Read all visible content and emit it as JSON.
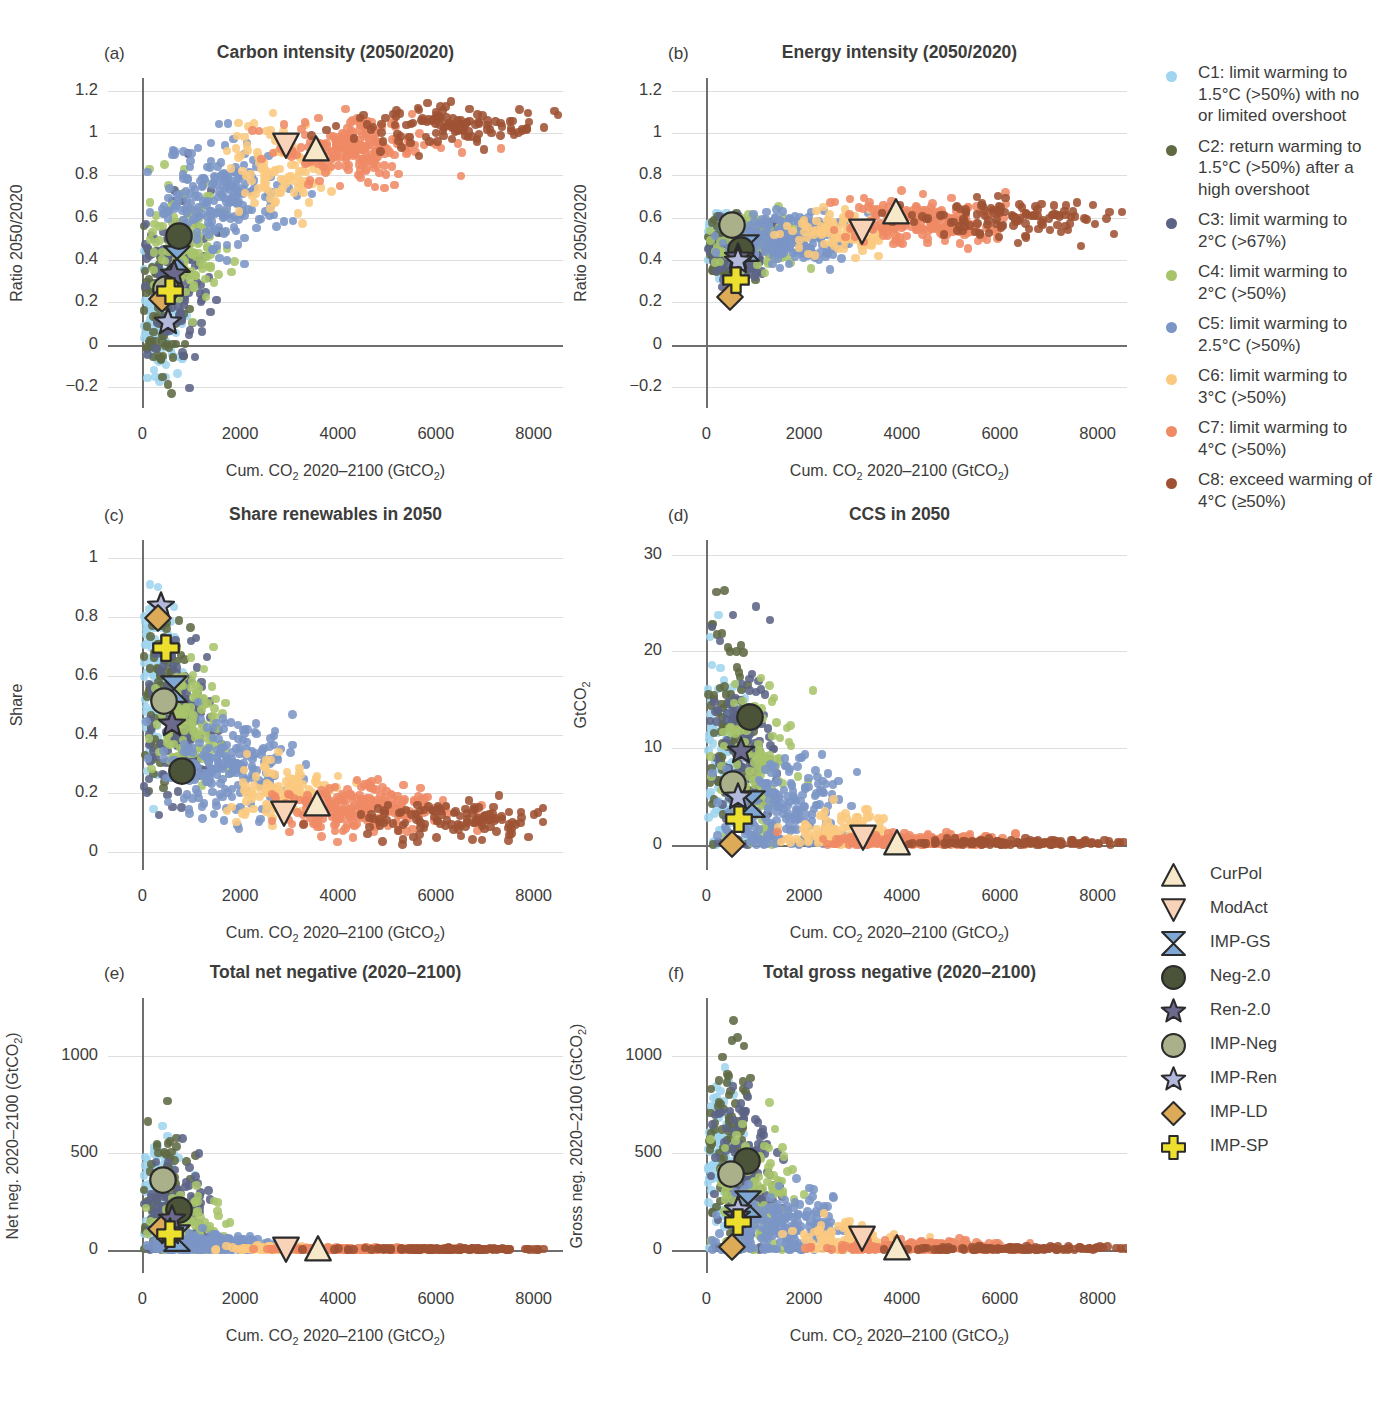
{
  "figure": {
    "cut_heading": "",
    "xlabel_html": "Cum. CO<sub>2</sub> 2020–2100 (GtCO<sub>2</sub>)"
  },
  "colors": {
    "C1": "#9fd5ef",
    "C2": "#5f6a43",
    "C3": "#5c6486",
    "C4": "#a7c46b",
    "C5": "#7b95c6",
    "C6": "#fac97f",
    "C7": "#ef8a65",
    "C8": "#9e5233",
    "axis": "#6f6f6e",
    "grid": "#dedede",
    "text": "#3c3c3b",
    "CurPol": "#f6e8c8",
    "ModAct": "#f9d3b8",
    "IMP-GS": "#7fa7d4",
    "Neg-2.0": "#4b5338",
    "Ren-2.0": "#6c6a8c",
    "IMP-Neg": "#aab18a",
    "IMP-Ren": "#b3b8dd",
    "IMP-LD": "#dda košt"
  },
  "category_legend": [
    {
      "key": "C1",
      "color": "#9fd5ef",
      "label": "C1: limit warming to 1.5°C (>50%) with no or limited overshoot"
    },
    {
      "key": "C2",
      "color": "#5f6a43",
      "label": "C2: return warming to 1.5°C (>50%) after a high overshoot"
    },
    {
      "key": "C3",
      "color": "#5c6486",
      "label": "C3: limit warming to 2°C (>67%)"
    },
    {
      "key": "C4",
      "color": "#a7c46b",
      "label": "C4: limit warming to 2°C (>50%)"
    },
    {
      "key": "C5",
      "color": "#7b95c6",
      "label": "C5: limit warming to 2.5°C (>50%)"
    },
    {
      "key": "C6",
      "color": "#fac97f",
      "label": "C6: limit warming to 3°C (>50%)"
    },
    {
      "key": "C7",
      "color": "#ef8a65",
      "label": "C7: limit warming to 4°C (>50%)"
    },
    {
      "key": "C8",
      "color": "#9e5233",
      "label": "C8: exceed warming of 4°C (≥50%)"
    }
  ],
  "marker_legend": [
    {
      "key": "CurPol",
      "shape": "triangle-up",
      "fill": "#f6e8c8",
      "label": "CurPol"
    },
    {
      "key": "ModAct",
      "shape": "triangle-down",
      "fill": "#f9d3b8",
      "label": "ModAct"
    },
    {
      "key": "IMP-GS",
      "shape": "bowtie",
      "fill": "#7fa7d4",
      "label": "IMP-GS"
    },
    {
      "key": "Neg-2.0",
      "shape": "circle",
      "fill": "#4b5338",
      "label": "Neg-2.0"
    },
    {
      "key": "Ren-2.0",
      "shape": "star",
      "fill": "#6c6a8c",
      "label": "Ren-2.0"
    },
    {
      "key": "IMP-Neg",
      "shape": "circle",
      "fill": "#aab18a",
      "label": "IMP-Neg"
    },
    {
      "key": "IMP-Ren",
      "shape": "star",
      "fill": "#b3b8dd",
      "label": "IMP-Ren"
    },
    {
      "key": "IMP-LD",
      "shape": "diamond",
      "fill": "#ddab57",
      "label": "IMP-LD"
    },
    {
      "key": "IMP-SP",
      "shape": "cross",
      "fill": "#ecdf2e",
      "label": "IMP-SP"
    }
  ],
  "chart_data": [
    {
      "panel": "a",
      "type": "scatter",
      "title": "Carbon intensity (2050/2020)",
      "xlabel_html": "Cum. CO<sub>2</sub> 2020–2100 (GtCO<sub>2</sub>)",
      "ylabel_html": "Ratio 2050/2020",
      "xlim": [
        -700,
        8600
      ],
      "ylim": [
        -0.3,
        1.26
      ],
      "xticks": [
        0,
        2000,
        4000,
        6000,
        8000
      ],
      "yticks": [
        -0.2,
        0,
        0.2,
        0.4,
        0.6,
        0.8,
        1,
        1.2
      ],
      "ytick_labels": [
        "−0.2",
        "0",
        "0.2",
        "0.4",
        "0.6",
        "0.8",
        "1",
        "1.2"
      ],
      "zero_y": 0,
      "grid": true,
      "markers": [
        {
          "key": "CurPol",
          "x": 3560,
          "y": 0.925
        },
        {
          "key": "ModAct",
          "x": 2940,
          "y": 0.945
        },
        {
          "key": "IMP-GS",
          "x": 700,
          "y": 0.405
        },
        {
          "key": "Neg-2.0",
          "x": 760,
          "y": 0.515
        },
        {
          "key": "Ren-2.0",
          "x": 650,
          "y": 0.335
        },
        {
          "key": "IMP-Neg",
          "x": 490,
          "y": 0.265
        },
        {
          "key": "IMP-Ren",
          "x": 530,
          "y": 0.105
        },
        {
          "key": "IMP-LD",
          "x": 400,
          "y": 0.215
        },
        {
          "key": "IMP-SP",
          "x": 560,
          "y": 0.255
        }
      ],
      "clouds": [
        {
          "key": "C1",
          "n": 95,
          "cx": 330,
          "cy": 0.07,
          "sx": 240,
          "sy": 0.14
        },
        {
          "key": "C2",
          "n": 85,
          "cx": 430,
          "cy": 0.17,
          "sx": 230,
          "sy": 0.16
        },
        {
          "key": "C3",
          "n": 140,
          "cx": 700,
          "cy": 0.33,
          "sx": 330,
          "sy": 0.17
        },
        {
          "key": "C4",
          "n": 120,
          "cx": 930,
          "cy": 0.49,
          "sx": 400,
          "sy": 0.15
        },
        {
          "key": "C5",
          "n": 200,
          "cx": 1600,
          "cy": 0.7,
          "sx": 600,
          "sy": 0.13
        },
        {
          "key": "C6",
          "n": 105,
          "cx": 2850,
          "cy": 0.83,
          "sx": 520,
          "sy": 0.1
        },
        {
          "key": "C7",
          "n": 215,
          "cx": 4350,
          "cy": 0.93,
          "sx": 800,
          "sy": 0.07
        },
        {
          "key": "C8",
          "n": 120,
          "cx": 6200,
          "cy": 1.03,
          "sx": 1050,
          "sy": 0.05
        }
      ]
    },
    {
      "panel": "b",
      "type": "scatter",
      "title": "Energy intensity (2050/2020)",
      "xlabel_html": "Cum. CO<sub>2</sub> 2020–2100 (GtCO<sub>2</sub>)",
      "ylabel_html": "Ratio 2050/2020",
      "xlim": [
        -700,
        8600
      ],
      "ylim": [
        -0.3,
        1.26
      ],
      "xticks": [
        0,
        2000,
        4000,
        6000,
        8000
      ],
      "yticks": [
        -0.2,
        0,
        0.2,
        0.4,
        0.6,
        0.8,
        1,
        1.2
      ],
      "ytick_labels": [
        "−0.2",
        "0",
        "0.2",
        "0.4",
        "0.6",
        "0.8",
        "1",
        "1.2"
      ],
      "zero_y": 0,
      "grid": true,
      "markers": [
        {
          "key": "CurPol",
          "x": 3880,
          "y": 0.625
        },
        {
          "key": "ModAct",
          "x": 3180,
          "y": 0.535
        },
        {
          "key": "IMP-GS",
          "x": 820,
          "y": 0.455
        },
        {
          "key": "Neg-2.0",
          "x": 700,
          "y": 0.445
        },
        {
          "key": "Ren-2.0",
          "x": 640,
          "y": 0.415
        },
        {
          "key": "IMP-Neg",
          "x": 520,
          "y": 0.565
        },
        {
          "key": "IMP-Ren",
          "x": 640,
          "y": 0.395
        },
        {
          "key": "IMP-LD",
          "x": 480,
          "y": 0.225
        },
        {
          "key": "IMP-SP",
          "x": 610,
          "y": 0.305
        }
      ],
      "clouds": [
        {
          "key": "C1",
          "n": 95,
          "cx": 330,
          "cy": 0.47,
          "sx": 240,
          "sy": 0.07
        },
        {
          "key": "C2",
          "n": 85,
          "cx": 440,
          "cy": 0.45,
          "sx": 230,
          "sy": 0.07
        },
        {
          "key": "C3",
          "n": 140,
          "cx": 760,
          "cy": 0.46,
          "sx": 340,
          "sy": 0.07
        },
        {
          "key": "C4",
          "n": 120,
          "cx": 950,
          "cy": 0.48,
          "sx": 400,
          "sy": 0.07
        },
        {
          "key": "C5",
          "n": 200,
          "cx": 1650,
          "cy": 0.5,
          "sx": 620,
          "sy": 0.06
        },
        {
          "key": "C6",
          "n": 105,
          "cx": 2850,
          "cy": 0.53,
          "sx": 520,
          "sy": 0.05
        },
        {
          "key": "C7",
          "n": 215,
          "cx": 4450,
          "cy": 0.58,
          "sx": 820,
          "sy": 0.05
        },
        {
          "key": "C8",
          "n": 120,
          "cx": 6250,
          "cy": 0.6,
          "sx": 1050,
          "sy": 0.05
        }
      ]
    },
    {
      "panel": "c",
      "type": "scatter",
      "title": "Share renewables in 2050",
      "xlabel_html": "Cum. CO<sub>2</sub> 2020–2100 (GtCO<sub>2</sub>)",
      "ylabel_html": "Share",
      "xlim": [
        -700,
        8600
      ],
      "ylim": [
        -0.06,
        1.06
      ],
      "xticks": [
        0,
        2000,
        4000,
        6000,
        8000
      ],
      "yticks": [
        0,
        0.2,
        0.4,
        0.6,
        0.8,
        1
      ],
      "ytick_labels": [
        "0",
        "0.2",
        "0.4",
        "0.6",
        "0.8",
        "1"
      ],
      "zero_y": null,
      "grid": true,
      "markers": [
        {
          "key": "CurPol",
          "x": 3580,
          "y": 0.165
        },
        {
          "key": "ModAct",
          "x": 2890,
          "y": 0.135
        },
        {
          "key": "IMP-GS",
          "x": 640,
          "y": 0.555
        },
        {
          "key": "Neg-2.0",
          "x": 810,
          "y": 0.275
        },
        {
          "key": "Ren-2.0",
          "x": 610,
          "y": 0.435
        },
        {
          "key": "IMP-Neg",
          "x": 440,
          "y": 0.515
        },
        {
          "key": "IMP-Ren",
          "x": 390,
          "y": 0.835
        },
        {
          "key": "IMP-LD",
          "x": 320,
          "y": 0.795
        },
        {
          "key": "IMP-SP",
          "x": 480,
          "y": 0.695
        }
      ],
      "clouds": [
        {
          "key": "C1",
          "n": 95,
          "cx": 300,
          "cy": 0.6,
          "sx": 220,
          "sy": 0.15
        },
        {
          "key": "C2",
          "n": 85,
          "cx": 420,
          "cy": 0.55,
          "sx": 230,
          "sy": 0.14
        },
        {
          "key": "C3",
          "n": 140,
          "cx": 730,
          "cy": 0.46,
          "sx": 330,
          "sy": 0.13
        },
        {
          "key": "C4",
          "n": 120,
          "cx": 980,
          "cy": 0.42,
          "sx": 400,
          "sy": 0.12
        },
        {
          "key": "C5",
          "n": 200,
          "cx": 1700,
          "cy": 0.29,
          "sx": 620,
          "sy": 0.08
        },
        {
          "key": "C6",
          "n": 105,
          "cx": 2850,
          "cy": 0.21,
          "sx": 520,
          "sy": 0.05
        },
        {
          "key": "C7",
          "n": 215,
          "cx": 4450,
          "cy": 0.15,
          "sx": 820,
          "sy": 0.04
        },
        {
          "key": "C8",
          "n": 120,
          "cx": 6300,
          "cy": 0.11,
          "sx": 1050,
          "sy": 0.035
        }
      ]
    },
    {
      "panel": "d",
      "type": "scatter",
      "title": "CCS in 2050",
      "xlabel_html": "Cum. CO<sub>2</sub> 2020–2100 (GtCO<sub>2</sub>)",
      "ylabel_html": "GtCO<sub>2</sub>",
      "xlim": [
        -700,
        8600
      ],
      "ylim": [
        -2.6,
        31.5
      ],
      "xticks": [
        0,
        2000,
        4000,
        6000,
        8000
      ],
      "yticks": [
        0,
        10,
        20,
        30
      ],
      "ytick_labels": [
        "0",
        "10",
        "20",
        "30"
      ],
      "zero_y": 0,
      "grid": true,
      "markers": [
        {
          "key": "CurPol",
          "x": 3900,
          "y": 0.2
        },
        {
          "key": "ModAct",
          "x": 3200,
          "y": 0.8
        },
        {
          "key": "IMP-GS",
          "x": 940,
          "y": 4.2
        },
        {
          "key": "Neg-2.0",
          "x": 900,
          "y": 13.2
        },
        {
          "key": "Ren-2.0",
          "x": 700,
          "y": 9.7
        },
        {
          "key": "IMP-Neg",
          "x": 540,
          "y": 6.3
        },
        {
          "key": "IMP-Ren",
          "x": 650,
          "y": 5.0
        },
        {
          "key": "IMP-LD",
          "x": 520,
          "y": 0.1
        },
        {
          "key": "IMP-SP",
          "x": 660,
          "y": 2.7
        }
      ],
      "clouds": [
        {
          "key": "C1",
          "n": 95,
          "cx": 330,
          "cy": 9.0,
          "sx": 230,
          "sy": 5.5
        },
        {
          "key": "C2",
          "n": 85,
          "cx": 450,
          "cy": 12.0,
          "sx": 240,
          "sy": 6.0
        },
        {
          "key": "C3",
          "n": 140,
          "cx": 780,
          "cy": 9.5,
          "sx": 340,
          "sy": 5.5
        },
        {
          "key": "C4",
          "n": 120,
          "cx": 1000,
          "cy": 7.5,
          "sx": 400,
          "sy": 4.5
        },
        {
          "key": "C5",
          "n": 200,
          "cx": 1600,
          "cy": 3.2,
          "sx": 600,
          "sy": 2.6
        },
        {
          "key": "C6",
          "n": 105,
          "cx": 2750,
          "cy": 1.1,
          "sx": 520,
          "sy": 1.2
        },
        {
          "key": "C7",
          "n": 215,
          "cx": 4300,
          "cy": 0.25,
          "sx": 820,
          "sy": 0.5
        },
        {
          "key": "C8",
          "n": 120,
          "cx": 6300,
          "cy": 0.08,
          "sx": 1050,
          "sy": 0.2
        }
      ]
    },
    {
      "panel": "e",
      "type": "scatter",
      "title": "Total net negative (2020–2100)",
      "xlabel_html": "Cum. CO<sub>2</sub> 2020–2100 (GtCO<sub>2</sub>)",
      "ylabel_html": "Net neg. 2020–2100 (GtCO<sub>2</sub>)",
      "xlim": [
        -700,
        8600
      ],
      "ylim": [
        -120,
        1300
      ],
      "xticks": [
        0,
        2000,
        4000,
        6000,
        8000
      ],
      "yticks": [
        0,
        500,
        1000
      ],
      "ytick_labels": [
        "0",
        "500",
        "1000"
      ],
      "zero_y": 0,
      "grid": true,
      "markers": [
        {
          "key": "CurPol",
          "x": 3590,
          "y": 6
        },
        {
          "key": "ModAct",
          "x": 2930,
          "y": 6
        },
        {
          "key": "IMP-GS",
          "x": 700,
          "y": 60
        },
        {
          "key": "Neg-2.0",
          "x": 740,
          "y": 205
        },
        {
          "key": "Ren-2.0",
          "x": 600,
          "y": 160
        },
        {
          "key": "IMP-Neg",
          "x": 420,
          "y": 360
        },
        {
          "key": "IMP-Ren",
          "x": 560,
          "y": 90
        },
        {
          "key": "IMP-LD",
          "x": 390,
          "y": 110
        },
        {
          "key": "IMP-SP",
          "x": 560,
          "y": 80
        }
      ],
      "clouds": [
        {
          "key": "C1",
          "n": 95,
          "cx": 300,
          "cy": 270,
          "sx": 220,
          "sy": 170
        },
        {
          "key": "C2",
          "n": 85,
          "cx": 420,
          "cy": 330,
          "sx": 230,
          "sy": 190
        },
        {
          "key": "C3",
          "n": 140,
          "cx": 700,
          "cy": 160,
          "sx": 330,
          "sy": 120
        },
        {
          "key": "C4",
          "n": 120,
          "cx": 950,
          "cy": 95,
          "sx": 400,
          "sy": 85
        },
        {
          "key": "C5",
          "n": 200,
          "cx": 1450,
          "cy": 25,
          "sx": 560,
          "sy": 30
        },
        {
          "key": "C6",
          "n": 105,
          "cx": 2700,
          "cy": 4,
          "sx": 520,
          "sy": 8
        },
        {
          "key": "C7",
          "n": 215,
          "cx": 4400,
          "cy": 2,
          "sx": 820,
          "sy": 4
        },
        {
          "key": "C8",
          "n": 120,
          "cx": 6300,
          "cy": 1,
          "sx": 1050,
          "sy": 3
        }
      ]
    },
    {
      "panel": "f",
      "type": "scatter",
      "title": "Total gross negative (2020–2100)",
      "xlabel_html": "Cum. CO<sub>2</sub> 2020–2100 (GtCO<sub>2</sub>)",
      "ylabel_html": "Gross neg. 2020–2100 (GtCO<sub>2</sub>)",
      "xlim": [
        -700,
        8600
      ],
      "ylim": [
        -120,
        1300
      ],
      "xticks": [
        0,
        2000,
        4000,
        6000,
        8000
      ],
      "yticks": [
        0,
        500,
        1000
      ],
      "ytick_labels": [
        "0",
        "500",
        "1000"
      ],
      "zero_y": 0,
      "grid": true,
      "markers": [
        {
          "key": "CurPol",
          "x": 3900,
          "y": 8
        },
        {
          "key": "ModAct",
          "x": 3180,
          "y": 60
        },
        {
          "key": "IMP-GS",
          "x": 860,
          "y": 235
        },
        {
          "key": "Neg-2.0",
          "x": 840,
          "y": 460
        },
        {
          "key": "Ren-2.0",
          "x": 620,
          "y": 175
        },
        {
          "key": "IMP-Neg",
          "x": 500,
          "y": 390
        },
        {
          "key": "IMP-Ren",
          "x": 640,
          "y": 205
        },
        {
          "key": "IMP-LD",
          "x": 520,
          "y": 15
        },
        {
          "key": "IMP-SP",
          "x": 650,
          "y": 145
        }
      ],
      "clouds": [
        {
          "key": "C1",
          "n": 95,
          "cx": 330,
          "cy": 420,
          "sx": 230,
          "sy": 240
        },
        {
          "key": "C2",
          "n": 85,
          "cx": 470,
          "cy": 560,
          "sx": 250,
          "sy": 270
        },
        {
          "key": "C3",
          "n": 140,
          "cx": 780,
          "cy": 390,
          "sx": 340,
          "sy": 210
        },
        {
          "key": "C4",
          "n": 120,
          "cx": 1020,
          "cy": 300,
          "sx": 400,
          "sy": 170
        },
        {
          "key": "C5",
          "n": 200,
          "cx": 1600,
          "cy": 120,
          "sx": 600,
          "sy": 100
        },
        {
          "key": "C6",
          "n": 105,
          "cx": 2750,
          "cy": 45,
          "sx": 520,
          "sy": 50
        },
        {
          "key": "C7",
          "n": 215,
          "cx": 4350,
          "cy": 12,
          "sx": 820,
          "sy": 18
        },
        {
          "key": "C8",
          "n": 120,
          "cx": 6300,
          "cy": 4,
          "sx": 1050,
          "sy": 6
        }
      ]
    }
  ]
}
